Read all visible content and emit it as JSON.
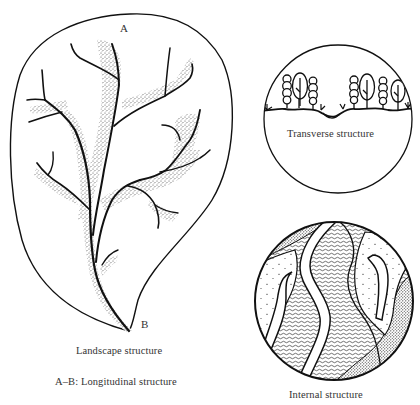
{
  "figure": {
    "panels": [
      {
        "id": "landscape",
        "caption": "Landscape structure",
        "points": {
          "start": "A",
          "end": "B"
        },
        "subcaption": "A–B: Longitudinal structure"
      },
      {
        "id": "transverse",
        "caption": "Transverse structure"
      },
      {
        "id": "internal",
        "caption": "Internal structure"
      }
    ],
    "colors": {
      "ink": "#111111",
      "stipple": "#555555",
      "text": "#333333",
      "background": "#ffffff"
    }
  }
}
